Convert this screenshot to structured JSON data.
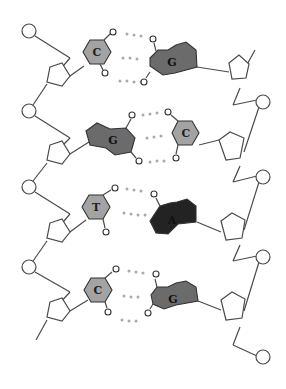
{
  "diagram": {
    "type": "dna-double-strand",
    "colors": {
      "pyrimidine_light": "#a3a3a3",
      "purine_dark": "#6b6b6b",
      "adenine_black": "#232323",
      "backbone": "#4a4a4a",
      "hydrogen_bond": "#a9a9a9",
      "label_on_light": "#1f1f1f",
      "label_on_dark": "#111111"
    },
    "base_pairs": [
      {
        "left": {
          "label": "C",
          "kind": "pyrimidine"
        },
        "right": {
          "label": "G",
          "kind": "purine"
        },
        "hydrogen_bonds": 3
      },
      {
        "left": {
          "label": "G",
          "kind": "purine"
        },
        "right": {
          "label": "C",
          "kind": "pyrimidine"
        },
        "hydrogen_bonds": 3
      },
      {
        "left": {
          "label": "T",
          "kind": "pyrimidine"
        },
        "right": {
          "label": "A",
          "kind": "purine"
        },
        "hydrogen_bonds": 2
      },
      {
        "left": {
          "label": "C",
          "kind": "pyrimidine"
        },
        "right": {
          "label": "G",
          "kind": "purine"
        },
        "hydrogen_bonds": 3
      }
    ]
  }
}
